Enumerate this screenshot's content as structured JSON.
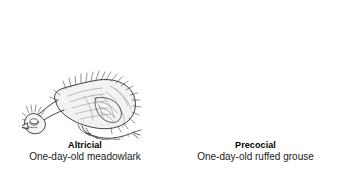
{
  "figure": {
    "background_color": "#ffffff",
    "ink_color": "#2b2b2b",
    "panels": [
      {
        "id": "altricial",
        "title": "Altricial",
        "subtitle": "One-day-old meadowlark",
        "illustration": "altricial-hatchling-illustration",
        "description": "Naked hatchling with sparse wispy down, eyes closed, head resting forward, legs unable to support body"
      },
      {
        "id": "precocial",
        "title": "Precocial",
        "subtitle": "One-day-old ruffed grouse",
        "illustration": "precocial-chick-illustration",
        "description": "Fully downy chick standing upright on well-developed legs with splayed toes, eyes open"
      }
    ]
  }
}
